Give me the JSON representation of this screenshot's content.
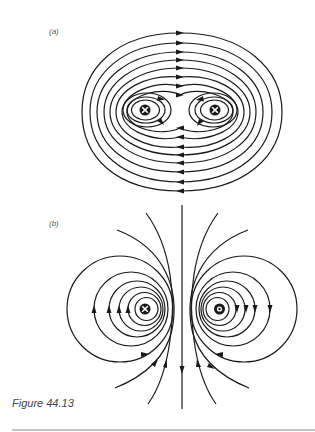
{
  "figure": {
    "caption": "Figure 44.13",
    "panels": [
      {
        "id": "a",
        "label": "(a)",
        "description": "Magnetic field lines of two parallel wires carrying current in the same direction (into page)",
        "conductors": [
          {
            "symbol": "cross",
            "meaning": "current into page",
            "x": 145,
            "y": 110
          },
          {
            "symbol": "cross",
            "meaning": "current into page",
            "x": 215,
            "y": 110
          }
        ],
        "top_lines_y": [
          33,
          43,
          52,
          60,
          68,
          77,
          86,
          95
        ],
        "bottom_lines_y": [
          128,
          137,
          147,
          155,
          163,
          172,
          182,
          191
        ],
        "top_arrow_direction": "right",
        "bottom_arrow_direction": "left"
      },
      {
        "id": "b",
        "label": "(b)",
        "description": "Magnetic field lines of two antiparallel wires (left into page, right out of page)",
        "conductors": [
          {
            "symbol": "cross",
            "meaning": "current into page",
            "x": 145,
            "y": 309
          },
          {
            "symbol": "dot",
            "meaning": "current out of page",
            "x": 219,
            "y": 309
          }
        ],
        "left_arrow_direction": "up",
        "right_arrow_direction": "down",
        "center_line_arrow_direction": "down"
      }
    ],
    "colors": {
      "line": "#1a1a1a",
      "label": "#555555",
      "rule": "#888888"
    }
  }
}
